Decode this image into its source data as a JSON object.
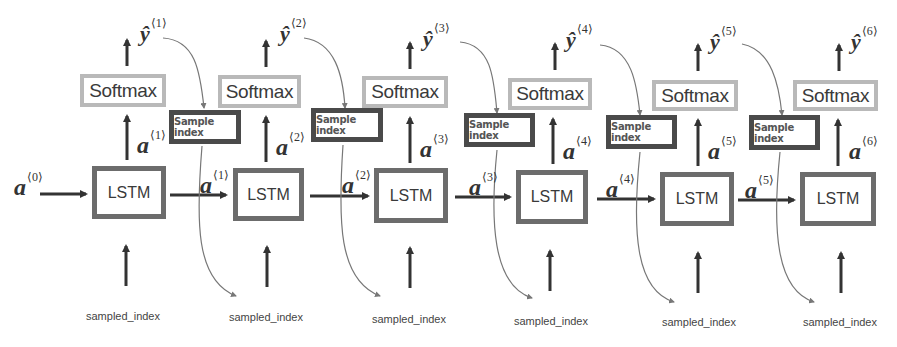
{
  "diagram": {
    "title": "",
    "initial_state": {
      "label": "a",
      "sup": "⟨0⟩"
    },
    "cells": [
      {
        "softmax": "Softmax",
        "lstm": "LSTM",
        "sample": "Sample index",
        "input": "sampled_index",
        "y": "ŷ",
        "y_sup": "⟨1⟩",
        "a": "a",
        "a_sup": "⟨1⟩"
      },
      {
        "softmax": "Softmax",
        "lstm": "LSTM",
        "sample": "Sample index",
        "input": "sampled_index",
        "y": "ŷ",
        "y_sup": "⟨2⟩",
        "a": "a",
        "a_sup": "⟨2⟩"
      },
      {
        "softmax": "Softmax",
        "lstm": "LSTM",
        "sample": "Sample index",
        "input": "sampled_index",
        "y": "ŷ",
        "y_sup": "⟨3⟩",
        "a": "a",
        "a_sup": "⟨3⟩"
      },
      {
        "softmax": "Softmax",
        "lstm": "LSTM",
        "sample": "Sample index",
        "input": "sampled_index",
        "y": "ŷ",
        "y_sup": "⟨4⟩",
        "a": "a",
        "a_sup": "⟨4⟩"
      },
      {
        "softmax": "Softmax",
        "lstm": "LSTM",
        "sample": "Sample index",
        "input": "sampled_index",
        "y": "ŷ",
        "y_sup": "⟨5⟩",
        "a": "a",
        "a_sup": "⟨5⟩"
      },
      {
        "softmax": "Softmax",
        "lstm": "LSTM",
        "input": "sampled_index",
        "y": "ŷ",
        "y_sup": "⟨6⟩",
        "a": "a",
        "a_sup": "⟨6⟩"
      }
    ],
    "transitions": [
      {
        "label": "a",
        "sup": "⟨1⟩"
      },
      {
        "label": "a",
        "sup": "⟨2⟩"
      },
      {
        "label": "a",
        "sup": "⟨3⟩"
      },
      {
        "label": "a",
        "sup": "⟨4⟩"
      },
      {
        "label": "a",
        "sup": "⟨5⟩"
      }
    ],
    "colors": {
      "arrow": "#333333",
      "lstm_border": "#6c6c6c",
      "softmax_border": "#b9b9b9",
      "sample_border": "#4a4a4a",
      "curve": "#777777"
    }
  }
}
